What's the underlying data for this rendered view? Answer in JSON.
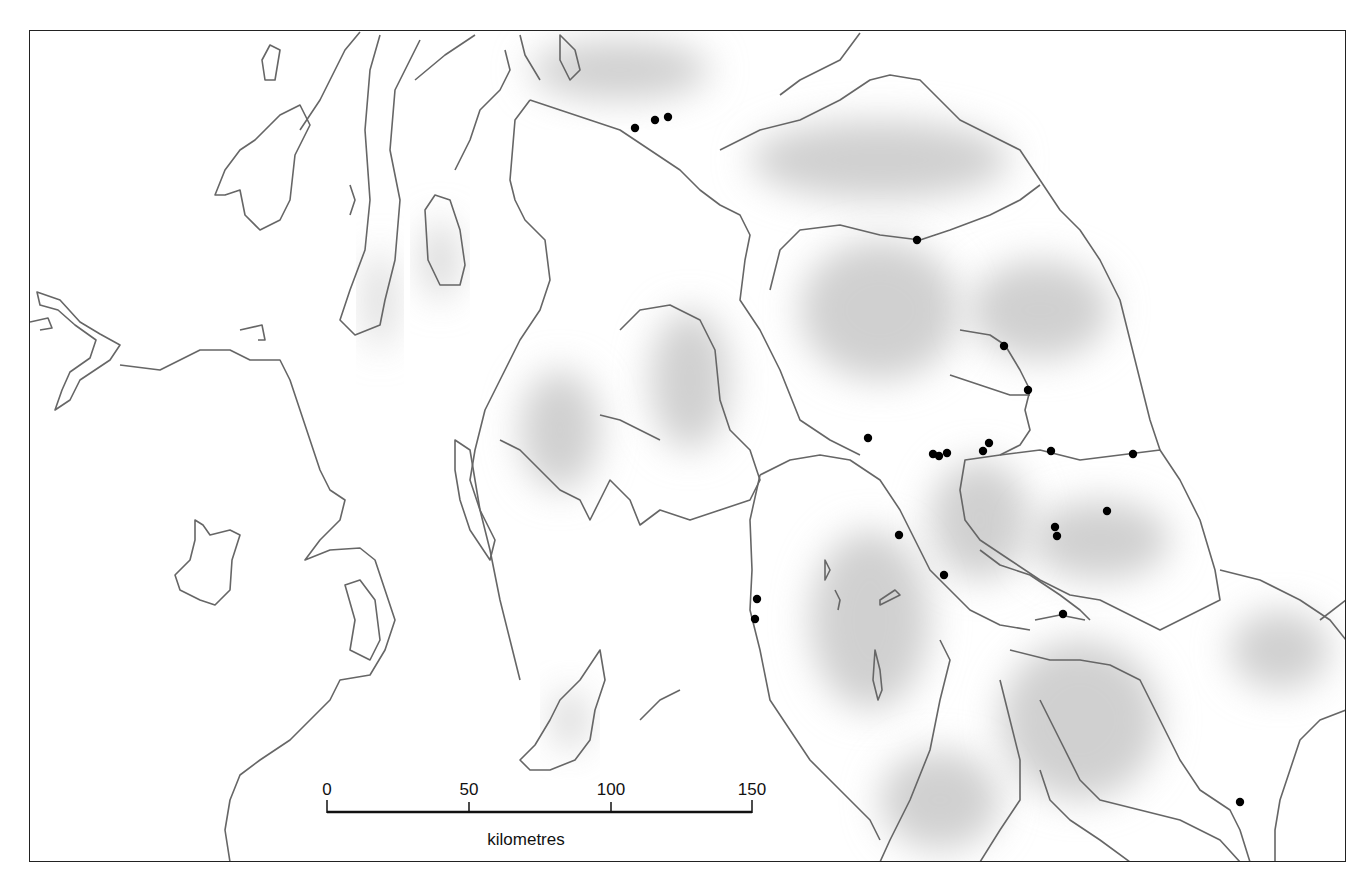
{
  "map": {
    "title": "",
    "frame": {
      "left": 29,
      "top": 30,
      "right": 1346,
      "bottom": 862
    },
    "colors": {
      "coast": "#666666",
      "relief": "#d0d0d0",
      "site": "#000000",
      "frame": "#222222"
    },
    "sites": [
      {
        "x": 635,
        "y": 128
      },
      {
        "x": 655,
        "y": 120
      },
      {
        "x": 668,
        "y": 117
      },
      {
        "x": 917,
        "y": 240
      },
      {
        "x": 1004,
        "y": 346
      },
      {
        "x": 1028,
        "y": 390
      },
      {
        "x": 868,
        "y": 438
      },
      {
        "x": 933,
        "y": 454
      },
      {
        "x": 939,
        "y": 456
      },
      {
        "x": 947,
        "y": 453
      },
      {
        "x": 983,
        "y": 451
      },
      {
        "x": 989,
        "y": 443
      },
      {
        "x": 1051,
        "y": 451
      },
      {
        "x": 1133,
        "y": 454
      },
      {
        "x": 899,
        "y": 535
      },
      {
        "x": 1055,
        "y": 527
      },
      {
        "x": 1057,
        "y": 536
      },
      {
        "x": 1107,
        "y": 511
      },
      {
        "x": 944,
        "y": 575
      },
      {
        "x": 757,
        "y": 599
      },
      {
        "x": 755,
        "y": 619
      },
      {
        "x": 1063,
        "y": 614
      },
      {
        "x": 1240,
        "y": 802
      }
    ]
  },
  "scale_bar": {
    "ticks": [
      {
        "label": "0",
        "x": 327
      },
      {
        "label": "50",
        "x": 469
      },
      {
        "label": "100",
        "x": 611
      },
      {
        "label": "150",
        "x": 752
      }
    ],
    "unit": "kilometres",
    "y": 812
  }
}
